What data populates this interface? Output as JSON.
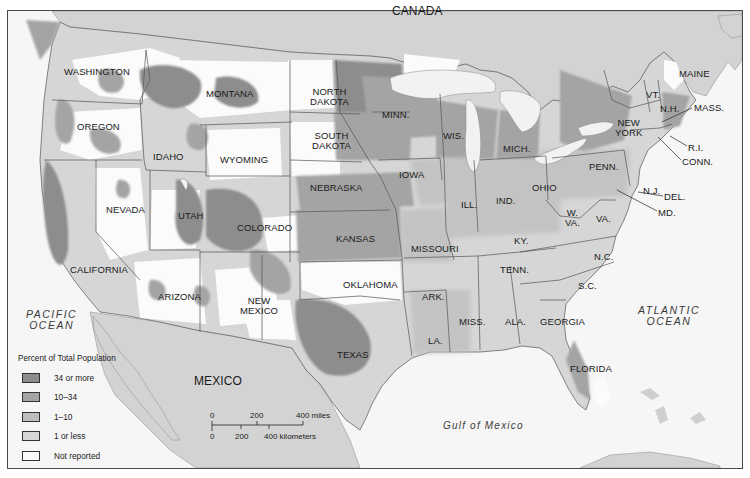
{
  "map": {
    "title": "Percent of Total Population",
    "colors": {
      "background": "#ffffff",
      "ocean": "#f6f6f6",
      "foreign_land": "#d3d3d3",
      "state_border": "#555555",
      "level_34_plus": "#8d8d8d",
      "level_10_34": "#a4a4a4",
      "level_1_10": "#bdbdbd",
      "level_1_less": "#d6d6d6",
      "level_not_reported": "#fbfbfb",
      "lake": "#f2f2f2"
    },
    "countries": [
      {
        "id": "canada",
        "label": "CANADA",
        "x": 392,
        "y": 6
      },
      {
        "id": "mexico",
        "label": "MEXICO",
        "x": 194,
        "y": 376
      }
    ],
    "oceans": [
      {
        "id": "pacific",
        "label": "PACIFIC\nOCEAN",
        "x": 26,
        "y": 309
      },
      {
        "id": "atlantic",
        "label": "ATLANTIC\nOCEAN",
        "x": 638,
        "y": 305
      },
      {
        "id": "gulf",
        "label": "Gulf of Mexico",
        "x": 443,
        "y": 421
      }
    ],
    "states": [
      {
        "name": "WASHINGTON",
        "x": 64,
        "y": 67
      },
      {
        "name": "OREGON",
        "x": 77,
        "y": 122
      },
      {
        "name": "IDAHO",
        "x": 153,
        "y": 152
      },
      {
        "name": "MONTANA",
        "x": 206,
        "y": 89
      },
      {
        "name": "WYOMING",
        "x": 220,
        "y": 155
      },
      {
        "name": "NORTH\nDAKOTA",
        "x": 310,
        "y": 87
      },
      {
        "name": "SOUTH\nDAKOTA",
        "x": 312,
        "y": 131
      },
      {
        "name": "NEBRASKA",
        "x": 310,
        "y": 183
      },
      {
        "name": "MINN.",
        "x": 382,
        "y": 110
      },
      {
        "name": "WIS.",
        "x": 443,
        "y": 131
      },
      {
        "name": "IOWA",
        "x": 399,
        "y": 170
      },
      {
        "name": "ILL.",
        "x": 461,
        "y": 200
      },
      {
        "name": "MICH.",
        "x": 503,
        "y": 144
      },
      {
        "name": "IND.",
        "x": 496,
        "y": 196
      },
      {
        "name": "OHIO",
        "x": 532,
        "y": 183
      },
      {
        "name": "PENN.",
        "x": 589,
        "y": 162
      },
      {
        "name": "NEW\nYORK",
        "x": 615,
        "y": 118
      },
      {
        "name": "VT.",
        "x": 646,
        "y": 90
      },
      {
        "name": "N.H.",
        "x": 660,
        "y": 104
      },
      {
        "name": "MAINE",
        "x": 679,
        "y": 69
      },
      {
        "name": "N.J.",
        "x": 643,
        "y": 186
      },
      {
        "name": "W.\nVA.",
        "x": 565,
        "y": 208
      },
      {
        "name": "VA.",
        "x": 596,
        "y": 214
      },
      {
        "name": "KY.",
        "x": 514,
        "y": 236
      },
      {
        "name": "NEVADA",
        "x": 106,
        "y": 205
      },
      {
        "name": "UTAH",
        "x": 178,
        "y": 211
      },
      {
        "name": "COLORADO",
        "x": 237,
        "y": 223
      },
      {
        "name": "KANSAS",
        "x": 336,
        "y": 234
      },
      {
        "name": "MISSOURI",
        "x": 411,
        "y": 244
      },
      {
        "name": "CALIFORNIA",
        "x": 70,
        "y": 265
      },
      {
        "name": "ARIZONA",
        "x": 158,
        "y": 292
      },
      {
        "name": "NEW\nMEXICO",
        "x": 240,
        "y": 296
      },
      {
        "name": "OKLAHOMA",
        "x": 343,
        "y": 280
      },
      {
        "name": "TEXAS",
        "x": 337,
        "y": 350
      },
      {
        "name": "ARK.",
        "x": 422,
        "y": 292
      },
      {
        "name": "TENN.",
        "x": 500,
        "y": 265
      },
      {
        "name": "N.C.",
        "x": 594,
        "y": 252
      },
      {
        "name": "S.C.",
        "x": 578,
        "y": 281
      },
      {
        "name": "MISS.",
        "x": 459,
        "y": 317
      },
      {
        "name": "ALA.",
        "x": 505,
        "y": 317
      },
      {
        "name": "GEORGIA",
        "x": 540,
        "y": 317
      },
      {
        "name": "LA.",
        "x": 428,
        "y": 336
      },
      {
        "name": "FLORIDA",
        "x": 570,
        "y": 364
      }
    ],
    "callouts": [
      {
        "name": "MASS.",
        "x": 694,
        "y": 103,
        "lx1": 692,
        "ly1": 108,
        "lx2": 662,
        "ly2": 122
      },
      {
        "name": "R.I.",
        "x": 688,
        "y": 143,
        "lx1": 687,
        "ly1": 146,
        "lx2": 670,
        "ly2": 136
      },
      {
        "name": "CONN.",
        "x": 682,
        "y": 157,
        "lx1": 681,
        "ly1": 160,
        "lx2": 658,
        "ly2": 137
      },
      {
        "name": "DEL.",
        "x": 664,
        "y": 192,
        "lx1": 663,
        "ly1": 196,
        "lx2": 638,
        "ly2": 192
      },
      {
        "name": "MD.",
        "x": 658,
        "y": 208,
        "lx1": 657,
        "ly1": 211,
        "lx2": 617,
        "ly2": 190
      }
    ]
  },
  "legend": {
    "title": "Percent of Total Population",
    "items": [
      {
        "label": "34 or more",
        "color": "#8d8d8d"
      },
      {
        "label": "10–34",
        "color": "#a4a4a4"
      },
      {
        "label": "1–10",
        "color": "#bdbdbd"
      },
      {
        "label": "1 or less",
        "color": "#d6d6d6"
      },
      {
        "label": "Not reported",
        "color": "#fbfbfb"
      }
    ]
  },
  "scale_bar": {
    "miles_ticks": [
      "0",
      "200",
      "400 miles"
    ],
    "km_ticks": [
      "0",
      "200",
      "400 kilometers"
    ]
  }
}
